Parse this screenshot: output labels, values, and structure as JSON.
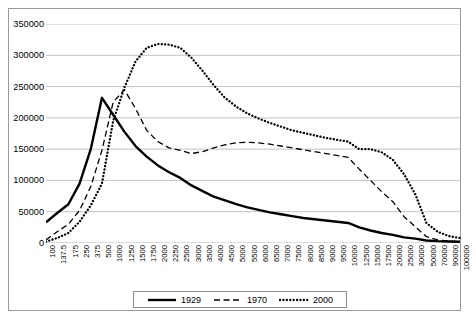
{
  "chart_data": {
    "type": "line",
    "title": "",
    "xlabel": "",
    "ylabel": "",
    "ylim": [
      0,
      350000
    ],
    "ytick_step": 50000,
    "grid": true,
    "legend_position": "bottom",
    "yticks": [
      "0",
      "50000",
      "100000",
      "150000",
      "200000",
      "250000",
      "300000",
      "350000"
    ],
    "categories": [
      "100",
      "137.5",
      "175",
      "250",
      "375",
      "500",
      "1000",
      "1250",
      "1500",
      "1750",
      "2000",
      "2250",
      "2500",
      "3000",
      "3500",
      "4000",
      "4500",
      "5000",
      "5500",
      "6000",
      "6500",
      "7000",
      "7500",
      "8000",
      "8500",
      "9000",
      "9500",
      "10000",
      "12500",
      "15000",
      "17500",
      "20000",
      "25000",
      "30000",
      "50000",
      "70000",
      "90000",
      "100000"
    ],
    "series": [
      {
        "name": "1929",
        "style": "solid",
        "color": "#000000",
        "values": [
          33000,
          48000,
          62000,
          95000,
          150000,
          232000,
          205000,
          178000,
          155000,
          138000,
          124000,
          113000,
          104000,
          92000,
          83000,
          74000,
          68000,
          62000,
          57000,
          53000,
          49000,
          46000,
          43000,
          40000,
          38000,
          36000,
          34000,
          32000,
          25000,
          20000,
          16000,
          13000,
          9000,
          7000,
          4000,
          3000,
          2500,
          2000
        ]
      },
      {
        "name": "1970",
        "style": "dashed",
        "color": "#000000",
        "values": [
          5000,
          18000,
          30000,
          52000,
          90000,
          148000,
          225000,
          245000,
          215000,
          180000,
          162000,
          152000,
          148000,
          143000,
          146000,
          152000,
          157000,
          160000,
          161000,
          160000,
          158000,
          155000,
          152000,
          149000,
          146000,
          143000,
          140000,
          137000,
          118000,
          100000,
          82000,
          66000,
          42000,
          26000,
          10000,
          5000,
          3000,
          2000
        ]
      },
      {
        "name": "2000",
        "style": "dotted",
        "color": "#000000",
        "values": [
          2000,
          8000,
          16000,
          34000,
          60000,
          95000,
          195000,
          248000,
          290000,
          312000,
          318000,
          317000,
          312000,
          296000,
          275000,
          252000,
          232000,
          218000,
          207000,
          199000,
          192000,
          186000,
          180000,
          176000,
          172000,
          168000,
          165000,
          162000,
          150000,
          150000,
          145000,
          133000,
          110000,
          78000,
          32000,
          18000,
          11000,
          8000
        ]
      }
    ],
    "legend": [
      {
        "label": "1929",
        "style": "solid"
      },
      {
        "label": "1970",
        "style": "dashed"
      },
      {
        "label": "2000",
        "style": "dotted"
      }
    ]
  }
}
